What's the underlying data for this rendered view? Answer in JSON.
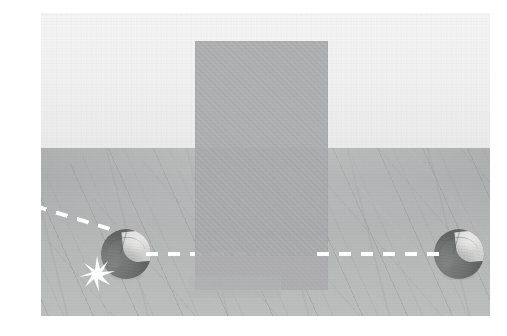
{
  "canvas": {
    "width": 507,
    "height": 336,
    "background_color": "#ffffff",
    "caption": ""
  },
  "scene": {
    "name": "two-spheres-behind-occluder",
    "description": "3D rendered room scene: a light back wall, a grey wooden plank floor, an upright translucent grey panel in the centre, and two identical two-tone spheres resting on the floor on either side of the panel. A white dashed trajectory comes in from the upper left, bends at the left sphere where a white impact star is drawn, then continues horizontally to the right, passing behind the panel and ending at the right sphere.",
    "frame": {
      "left": 41,
      "top": 13,
      "width": 449,
      "height": 303
    },
    "horizon_y": 148
  },
  "wall": {
    "label": "back-wall",
    "color": "#f0f0f1",
    "height": 135
  },
  "floor": {
    "label": "wood-plank-floor",
    "base_color": "#b5b6b6",
    "grain_color": "#7e8080",
    "highlight_color": "#c9caca",
    "grain_angle_deg": -24
  },
  "panel": {
    "label": "occluder-panel",
    "color": "#a8a9aa",
    "opacity": 0.92,
    "left": 154,
    "top": 28,
    "width": 133,
    "height": 249
  },
  "objects": [
    {
      "id": "ball-left",
      "label": "sphere-left",
      "shape": "sphere",
      "dark_color": "#838585",
      "light_color": "#dcdcdb",
      "left": 60,
      "top": 216,
      "diameter": 50,
      "state": "impacted"
    },
    {
      "id": "ball-right",
      "label": "sphere-right",
      "shape": "sphere",
      "dark_color": "#838585",
      "light_color": "#dcdcdb",
      "left": 393,
      "top": 216,
      "diameter": 50,
      "state": "at-rest"
    }
  ],
  "trajectory": {
    "label": "dashed-motion-path",
    "color": "#ffffff",
    "style": "dashed",
    "thickness": 4,
    "segments": [
      {
        "id": "dash-incoming",
        "from": [
          35,
          204
        ],
        "to": [
          119,
          230
        ],
        "angle_deg": 17,
        "note": "enters frame at left edge, descends toward left sphere"
      },
      {
        "id": "dash-mid",
        "from": [
          146,
          252
        ],
        "to": [
          260,
          252
        ],
        "angle_deg": 0,
        "note": "horizontal, ends where the panel occludes it"
      },
      {
        "id": "dash-right",
        "from": [
          317,
          252
        ],
        "to": [
          441,
          252
        ],
        "angle_deg": 0,
        "note": "resumes past the panel, ends at right sphere"
      }
    ]
  },
  "impact": {
    "label": "impact-star",
    "color": "#ffffff",
    "center": [
      96,
      274
    ],
    "points": 8,
    "size": 36
  }
}
